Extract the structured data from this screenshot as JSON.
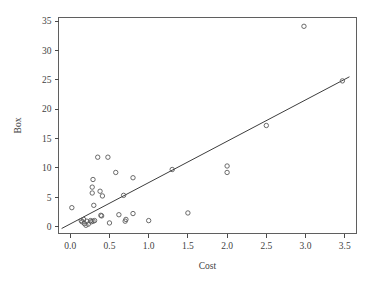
{
  "chart_data": {
    "type": "scatter",
    "title": "",
    "xlabel": "Cost",
    "ylabel": "Box",
    "xlim": [
      -0.15,
      3.65
    ],
    "ylim": [
      -1.2,
      35.6
    ],
    "xticks": [
      0.0,
      0.5,
      1.0,
      1.5,
      2.0,
      2.5,
      3.0,
      3.5
    ],
    "xticklabels": [
      "0.0",
      "0.5",
      "1.0",
      "1.5",
      "2.0",
      "2.5",
      "3.0",
      "3.5"
    ],
    "yticks": [
      0,
      5,
      10,
      15,
      20,
      25,
      30,
      35
    ],
    "yticklabels": [
      "0",
      "5",
      "10",
      "15",
      "20",
      "25",
      "30",
      "35"
    ],
    "grid": false,
    "legend": false,
    "marker": "open-circle",
    "marker_color": "#5a5a5a",
    "line_color": "#3d3d3d",
    "points": [
      {
        "x": 0.02,
        "y": 3.2
      },
      {
        "x": 0.14,
        "y": 1.0
      },
      {
        "x": 0.15,
        "y": 0.8
      },
      {
        "x": 0.17,
        "y": 1.2
      },
      {
        "x": 0.18,
        "y": 0.5
      },
      {
        "x": 0.2,
        "y": 0.2
      },
      {
        "x": 0.21,
        "y": 0.9
      },
      {
        "x": 0.23,
        "y": 0.4
      },
      {
        "x": 0.26,
        "y": 1.0
      },
      {
        "x": 0.27,
        "y": 0.8
      },
      {
        "x": 0.29,
        "y": 0.9
      },
      {
        "x": 0.28,
        "y": 6.7
      },
      {
        "x": 0.28,
        "y": 5.7
      },
      {
        "x": 0.29,
        "y": 8.0
      },
      {
        "x": 0.3,
        "y": 3.6
      },
      {
        "x": 0.31,
        "y": 1.0
      },
      {
        "x": 0.35,
        "y": 11.8
      },
      {
        "x": 0.38,
        "y": 6.0
      },
      {
        "x": 0.39,
        "y": 1.9
      },
      {
        "x": 0.4,
        "y": 1.8
      },
      {
        "x": 0.41,
        "y": 5.2
      },
      {
        "x": 0.48,
        "y": 11.8
      },
      {
        "x": 0.5,
        "y": 0.6
      },
      {
        "x": 0.58,
        "y": 9.2
      },
      {
        "x": 0.62,
        "y": 2.0
      },
      {
        "x": 0.68,
        "y": 5.3
      },
      {
        "x": 0.7,
        "y": 0.9
      },
      {
        "x": 0.71,
        "y": 1.2
      },
      {
        "x": 0.8,
        "y": 8.3
      },
      {
        "x": 0.8,
        "y": 2.2
      },
      {
        "x": 1.0,
        "y": 1.0
      },
      {
        "x": 1.3,
        "y": 9.7
      },
      {
        "x": 1.5,
        "y": 2.3
      },
      {
        "x": 2.0,
        "y": 10.3
      },
      {
        "x": 2.0,
        "y": 9.2
      },
      {
        "x": 2.5,
        "y": 17.2
      },
      {
        "x": 2.98,
        "y": 34.1
      },
      {
        "x": 3.47,
        "y": 24.8
      }
    ],
    "fit_line": {
      "x0": -0.11,
      "y0": -0.35,
      "x1": 3.56,
      "y1": 25.5
    }
  }
}
